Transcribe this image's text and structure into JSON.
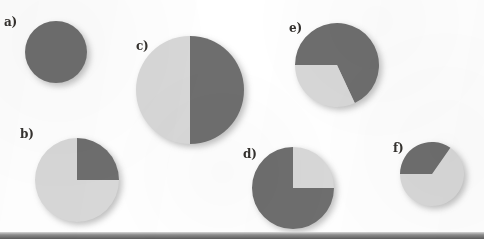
{
  "figure": {
    "background_color": "#ffffff",
    "width": 484,
    "height": 239,
    "bottom_rule_color": "#5c5c5c"
  },
  "colors": {
    "dark_slice": "#6e6e6e",
    "light_slice": "#d8d8d8",
    "label_text": "#35322f",
    "shadow": "rgba(70,70,70,0.34)"
  },
  "labels": {
    "a": "a)",
    "b": "b)",
    "c": "c)",
    "d": "d)",
    "e": "e)",
    "f": "f)"
  },
  "chart_data": [
    {
      "type": "pie",
      "title": "a)",
      "id": "pie-a",
      "center": [
        56,
        52
      ],
      "radius": 31,
      "categories": [
        "dark",
        "light"
      ],
      "values": [
        100,
        0
      ],
      "unit": "percent",
      "slices": [
        {
          "name": "dark",
          "percent": 100,
          "start_angle_deg": 0,
          "end_angle_deg": 360,
          "color": "#6e6e6e"
        }
      ],
      "legend": "none",
      "grid": false
    },
    {
      "type": "pie",
      "title": "b)",
      "id": "pie-b",
      "center": [
        77,
        180
      ],
      "radius": 42,
      "categories": [
        "dark",
        "light"
      ],
      "values": [
        25,
        75
      ],
      "unit": "percent",
      "slices": [
        {
          "name": "dark",
          "percent": 25,
          "start_angle_deg": 0,
          "end_angle_deg": 90,
          "color": "#6e6e6e"
        },
        {
          "name": "light",
          "percent": 75,
          "start_angle_deg": 90,
          "end_angle_deg": 360,
          "color": "#d8d8d8"
        }
      ],
      "legend": "none",
      "grid": false
    },
    {
      "type": "pie",
      "title": "c)",
      "id": "pie-c",
      "center": [
        190,
        90
      ],
      "radius": 54,
      "categories": [
        "dark",
        "light"
      ],
      "values": [
        50,
        50
      ],
      "unit": "percent",
      "slices": [
        {
          "name": "dark",
          "percent": 50,
          "start_angle_deg": 0,
          "end_angle_deg": 180,
          "color": "#6e6e6e"
        },
        {
          "name": "light",
          "percent": 50,
          "start_angle_deg": 180,
          "end_angle_deg": 360,
          "color": "#d8d8d8"
        }
      ],
      "legend": "none",
      "grid": false
    },
    {
      "type": "pie",
      "title": "d)",
      "id": "pie-d",
      "center": [
        293,
        188
      ],
      "radius": 41,
      "categories": [
        "dark",
        "light"
      ],
      "values": [
        75,
        25
      ],
      "unit": "percent",
      "slices": [
        {
          "name": "light",
          "percent": 25,
          "start_angle_deg": 0,
          "end_angle_deg": 90,
          "color": "#d8d8d8"
        },
        {
          "name": "dark",
          "percent": 75,
          "start_angle_deg": 90,
          "end_angle_deg": 360,
          "color": "#6e6e6e"
        }
      ],
      "legend": "none",
      "grid": false
    },
    {
      "type": "pie",
      "title": "e)",
      "id": "pie-e",
      "center": [
        337,
        65
      ],
      "radius": 42,
      "categories": [
        "dark",
        "light"
      ],
      "values": [
        68,
        32
      ],
      "unit": "percent",
      "slices": [
        {
          "name": "dark",
          "percent": 68,
          "start_angle_deg": 270,
          "end_angle_deg": 515,
          "color": "#6e6e6e"
        },
        {
          "name": "light",
          "percent": 32,
          "start_angle_deg": 155,
          "end_angle_deg": 270,
          "color": "#d8d8d8"
        }
      ],
      "legend": "none",
      "grid": false
    },
    {
      "type": "pie",
      "title": "f)",
      "id": "pie-f",
      "center": [
        432,
        174
      ],
      "radius": 32,
      "categories": [
        "dark",
        "light"
      ],
      "values": [
        35,
        65
      ],
      "unit": "percent",
      "slices": [
        {
          "name": "light",
          "percent": 65,
          "start_angle_deg": 35,
          "end_angle_deg": 270,
          "color": "#d8d8d8"
        },
        {
          "name": "dark",
          "percent": 35,
          "start_angle_deg": 270,
          "end_angle_deg": 395,
          "color": "#6e6e6e"
        }
      ],
      "legend": "none",
      "grid": false
    }
  ]
}
